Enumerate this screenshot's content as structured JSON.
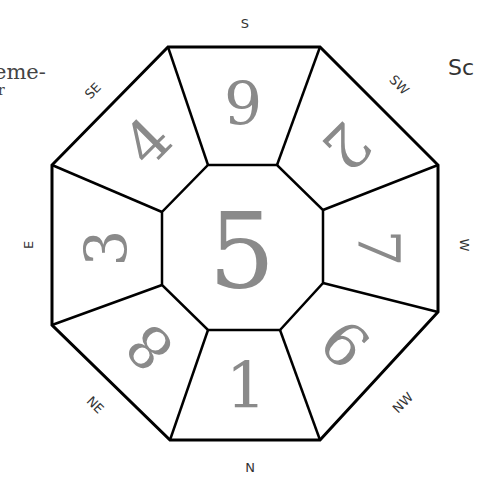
{
  "edge_text": {
    "left_fragment": "eme-",
    "left_fragment_2": "r",
    "right_fragment": "Sc"
  },
  "directions": {
    "s": "S",
    "sw": "SW",
    "w": "W",
    "nw": "NW",
    "n": "N",
    "ne": "NE",
    "e": "E",
    "se": "SE"
  },
  "sectors": {
    "center": "5",
    "s": "9",
    "sw": "2",
    "w": "7",
    "nw": "6",
    "n": "1",
    "ne": "8",
    "e": "3",
    "se": "4"
  },
  "colors": {
    "numeral": "#8a8a8a",
    "line": "#000000",
    "label": "#333333"
  }
}
